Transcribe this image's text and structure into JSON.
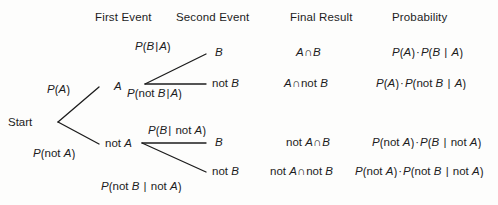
{
  "diagram": {
    "type": "probability-tree",
    "background_color": "#fdfdfc",
    "line_color": "#1c1c1c"
  },
  "columns": {
    "first_event": "First Event",
    "second_event": "Second Event",
    "final_result": "Final Result",
    "probability": "Probability"
  },
  "root": {
    "label": "Start"
  },
  "first_level": {
    "branch_a": {
      "node_label": "A",
      "probability_label_p": "P",
      "probability_label_open": "(",
      "probability_label_arg": "A",
      "probability_label_close": ")"
    },
    "branch_not_a": {
      "node_label_not": "not ",
      "node_label_var": "A",
      "probability_label_p": "P",
      "probability_label_open": "(",
      "probability_label_not": "not ",
      "probability_label_arg": "A",
      "probability_label_close": ")"
    }
  },
  "second_level": {
    "b_given_a": {
      "node_label": "B",
      "p": "P",
      "open": "(",
      "arg": "B",
      "bar": "|",
      "cond": "A",
      "close": ")"
    },
    "not_b_given_a": {
      "node_label_not": "not ",
      "node_label_var": "B",
      "p": "P",
      "open": "(",
      "not": "not ",
      "arg": "B",
      "bar": "|",
      "cond": "A",
      "close": ")"
    },
    "b_given_not_a": {
      "node_label": "B",
      "p": "P",
      "open": "(",
      "arg": "B",
      "bar": "|",
      "cond_not": " not ",
      "cond": "A",
      "close": ")"
    },
    "not_b_given_not_a": {
      "node_label_not": "not ",
      "node_label_var": "B",
      "p": "P",
      "open": "(",
      "not": "not ",
      "arg": "B",
      "bar": " | ",
      "cond_not": "not ",
      "cond": "A",
      "close": ")"
    }
  },
  "results": {
    "row1": {
      "a": "A",
      "cap": "∩",
      "b": "B"
    },
    "row2": {
      "a": "A",
      "cap": "∩",
      "not": "not ",
      "b": "B"
    },
    "row3": {
      "not_a": "not ",
      "a": "A",
      "cap": "∩",
      "b": "B"
    },
    "row4": {
      "not_a": "not ",
      "a": "A",
      "cap": "∩",
      "not_b": "not ",
      "b": "B"
    }
  },
  "probabilities": {
    "row1": {
      "p1": "P",
      "o1": "(",
      "a1": "A",
      "c1": ")",
      "dot": "·",
      "p2": "P",
      "o2": "(",
      "a2": "B",
      "bar": " | ",
      "cond": "A",
      "c2": ")"
    },
    "row2": {
      "p1": "P",
      "o1": "(",
      "a1": "A",
      "c1": ")",
      "dot": "·",
      "p2": "P",
      "o2": "(",
      "not": "not ",
      "a2": "B",
      "bar": " | ",
      "cond": "A",
      "c2": ")"
    },
    "row3": {
      "p1": "P",
      "o1": "(",
      "not1": "not ",
      "a1": "A",
      "c1": ")",
      "dot": "·",
      "p2": "P",
      "o2": "(",
      "a2": "B",
      "bar": " | ",
      "cond_not": "not ",
      "cond": "A",
      "c2": ")"
    },
    "row4": {
      "p1": "P",
      "o1": "(",
      "not1": "not ",
      "a1": "A",
      "c1": ")",
      "dot": "·",
      "p2": "P",
      "o2": "(",
      "not2": "not ",
      "a2": "B",
      "bar": " | ",
      "cond_not": "not ",
      "cond": "A",
      "c2": ")"
    }
  }
}
